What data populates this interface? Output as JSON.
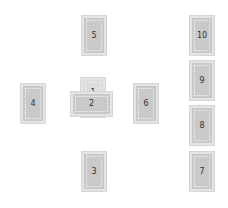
{
  "diagram": {
    "type": "tarot-spread",
    "layout": "celtic-cross",
    "cards": [
      {
        "position": 1,
        "label": "1",
        "orientation": "vertical",
        "x": 81,
        "y": 78
      },
      {
        "position": 2,
        "label": "2",
        "orientation": "horizontal",
        "x": 71,
        "y": 92
      },
      {
        "position": 3,
        "label": "3",
        "orientation": "vertical",
        "x": 82,
        "y": 152
      },
      {
        "position": 4,
        "label": "4",
        "orientation": "vertical",
        "x": 21,
        "y": 84
      },
      {
        "position": 5,
        "label": "5",
        "orientation": "vertical",
        "x": 82,
        "y": 16
      },
      {
        "position": 6,
        "label": "6",
        "orientation": "vertical",
        "x": 134,
        "y": 84
      },
      {
        "position": 7,
        "label": "7",
        "orientation": "vertical",
        "x": 190,
        "y": 152
      },
      {
        "position": 8,
        "label": "8",
        "orientation": "vertical",
        "x": 190,
        "y": 106
      },
      {
        "position": 9,
        "label": "9",
        "orientation": "vertical",
        "x": 190,
        "y": 61
      },
      {
        "position": 10,
        "label": "10",
        "orientation": "vertical",
        "x": 190,
        "y": 16
      }
    ],
    "colors": {
      "card_fill": "#c9c9c9",
      "card_border": "#e4e4e4",
      "background": "#ffffff"
    }
  }
}
